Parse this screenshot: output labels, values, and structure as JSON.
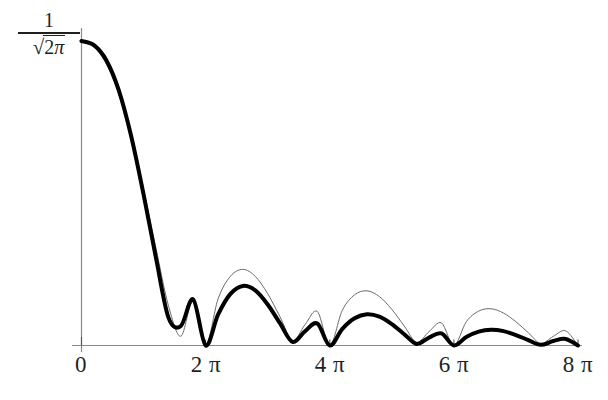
{
  "figure": {
    "background_color": "#ffffff",
    "axis_color": "#8a8a8a",
    "curve_thick_color": "#000000",
    "curve_thin_color": "#6b6b6b"
  },
  "axes": {
    "y_axis_label_numerator": "1",
    "y_axis_label_radical_sign": "√",
    "y_axis_label_radicand_coefficient": "2",
    "y_axis_label_radicand_symbol": "π",
    "x_tick_labels": [
      "0",
      "2 π",
      "4 π",
      "6 π",
      "8 π"
    ]
  },
  "chart_data": {
    "type": "line",
    "title": "",
    "xlabel": "",
    "ylabel": "1/√(2π)",
    "xlim": [
      0,
      25.1327
    ],
    "ylim": [
      0,
      0.3989
    ],
    "grid": false,
    "legend": null,
    "x_tick_values": [
      0,
      6.2832,
      12.5664,
      18.8496,
      25.1327
    ],
    "x_tick_labels": [
      "0",
      "2 π",
      "4 π",
      "6 π",
      "8 π"
    ],
    "y_tick_values": [
      0.3989
    ],
    "y_tick_labels": [
      "1/√(2π)"
    ],
    "annotations": [],
    "series": [
      {
        "name": "thick-curve",
        "style": "solid",
        "line_width": 4,
        "color": "#000000",
        "description": "Rapidly decaying oscillatory kernel; zeros at 2π, 4π, 6π, 8π; value at x=0 is 1/√(2π)",
        "x": [
          0,
          0.6283,
          1.2566,
          1.885,
          2.5133,
          3.1416,
          3.7699,
          4.3982,
          5.0265,
          5.6549,
          6.2832,
          6.9115,
          7.5398,
          8.1681,
          8.7965,
          9.4248,
          10.0531,
          10.6814,
          11.3097,
          11.9381,
          12.5664,
          13.1947,
          13.823,
          14.4513,
          15.0796,
          15.708,
          16.3363,
          16.9646,
          17.5929,
          18.2212,
          18.8496,
          19.4779,
          20.1062,
          20.7345,
          21.3628,
          21.9911,
          22.6195,
          23.2478,
          23.8761,
          24.5044,
          25.1327
        ],
        "y": [
          0.3989,
          0.3935,
          0.3737,
          0.3345,
          0.2744,
          0.1979,
          0.1147,
          0.0369,
          0.0255,
          0.0603,
          0.0,
          0.0404,
          0.0676,
          0.078,
          0.0721,
          0.0537,
          0.0289,
          0.0047,
          0.0186,
          0.0287,
          0.0,
          0.0215,
          0.0356,
          0.0409,
          0.0378,
          0.028,
          0.0148,
          0.0021,
          0.0104,
          0.0159,
          0.0,
          0.0111,
          0.0181,
          0.0206,
          0.0188,
          0.0137,
          0.0071,
          0.0009,
          0.0058,
          0.0086,
          0.0
        ]
      },
      {
        "name": "thin-curve",
        "style": "solid",
        "line_width": 1,
        "color": "#6b6b6b",
        "description": "Slowly decaying |sinc|-type envelope; zeros at 2π, 4π, 6π, 8π; value at x=0 is 1/√(2π)",
        "x": [
          0,
          0.6283,
          1.2566,
          1.885,
          2.5133,
          3.1416,
          3.7699,
          4.3982,
          5.0265,
          5.6549,
          6.2832,
          6.9115,
          7.5398,
          8.1681,
          8.7965,
          9.4248,
          10.0531,
          10.6814,
          11.3097,
          11.9381,
          12.5664,
          13.1947,
          13.823,
          14.4513,
          15.0796,
          15.708,
          16.3363,
          16.9646,
          17.5929,
          18.2212,
          18.8496,
          19.4779,
          20.1062,
          20.7345,
          21.3628,
          21.9911,
          22.6195,
          23.2478,
          23.8761,
          24.5044,
          25.1327
        ],
        "y": [
          0.3989,
          0.3912,
          0.3687,
          0.3296,
          0.2736,
          0.2039,
          0.1274,
          0.0525,
          0.0121,
          0.0591,
          0.0,
          0.0609,
          0.0907,
          0.0997,
          0.0906,
          0.0679,
          0.0374,
          0.0063,
          0.0271,
          0.0445,
          0.0,
          0.0456,
          0.0664,
          0.0716,
          0.0641,
          0.0473,
          0.0256,
          0.0042,
          0.0182,
          0.0296,
          0.0,
          0.0311,
          0.0451,
          0.0481,
          0.0425,
          0.0311,
          0.0167,
          0.0027,
          0.0119,
          0.0193,
          0.0
        ]
      }
    ]
  }
}
